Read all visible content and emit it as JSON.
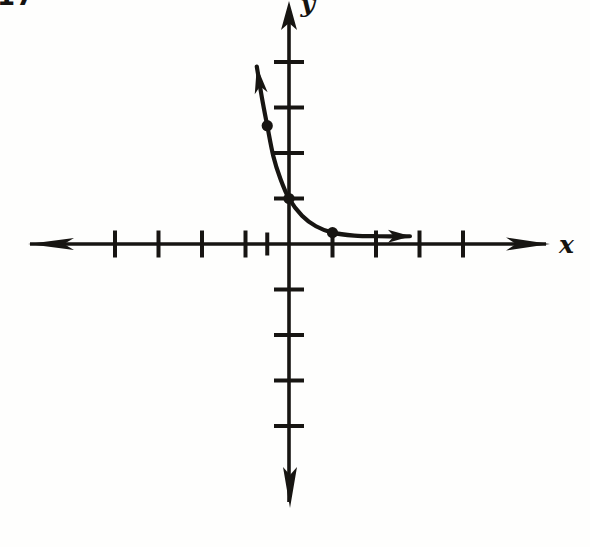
{
  "page": {
    "problem_number": "17",
    "background_color": "#fefefd",
    "ink_color": "#171512"
  },
  "chart_data": {
    "type": "line",
    "title": "",
    "xlabel": "x",
    "ylabel": "y",
    "xlim": [
      -6.0,
      6.9
    ],
    "ylim": [
      -5.9,
      5.4
    ],
    "grid": false,
    "axis_style": "crossed axes with solid arrowheads on all four ends, unlabeled unit tick marks",
    "x_ticks": [
      -4,
      -3,
      -2,
      -1,
      -0.5,
      1,
      2,
      3,
      4
    ],
    "y_ticks": [
      -4,
      -3,
      -2,
      -1,
      1,
      2,
      3,
      4
    ],
    "tick_labels_shown": false,
    "series": [
      {
        "name": "exponential-decay-curve",
        "shape": "decreasing, concave-up exponential decay with horizontal asymptote y = 0 as x increases; rises steeply for negative x",
        "x": [
          -0.74,
          -0.62,
          -0.5,
          -0.36,
          -0.2,
          0,
          0.3,
          0.62,
          1.0,
          1.5,
          2.05,
          2.78
        ],
        "y": [
          3.9,
          3.2,
          2.6,
          1.93,
          1.44,
          1.0,
          0.62,
          0.39,
          0.25,
          0.185,
          0.17,
          0.17
        ],
        "arrow_at_start": true,
        "arrow_at_end": true
      }
    ],
    "marked_points": [
      {
        "x": -0.5,
        "y": 2.6
      },
      {
        "x": 0,
        "y": 1
      },
      {
        "x": 1,
        "y": 0.25
      }
    ],
    "y_intercept": "(0, 1)",
    "color": "#171512"
  }
}
